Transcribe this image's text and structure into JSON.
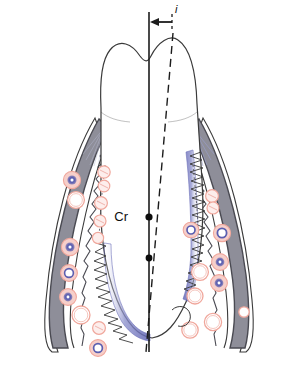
{
  "figure": {
    "type": "anatomical-diagram",
    "width": 298,
    "height": 365,
    "background_color": "#ffffff"
  },
  "labels": {
    "center_of_resistance": "Cr",
    "displacement_measure": "i"
  },
  "annotations": {
    "vertical_reference_line": {
      "name": "long-axis-reference-line",
      "style": "solid",
      "color": "#1c1c1c"
    },
    "tilted_axis_line": {
      "name": "tipped-tooth-axis-line",
      "style": "dashed",
      "color": "#1c1c1c"
    },
    "arrow": {
      "name": "displacement-arrow",
      "direction": "left",
      "color": "#1c1c1c"
    },
    "markers": [
      {
        "name": "center-of-resistance-dot",
        "label": "Cr"
      },
      {
        "name": "rotation-center-dot",
        "label": ""
      }
    ]
  },
  "structures": {
    "crown": {
      "name": "tooth-crown",
      "fill": "#ffffff",
      "stroke": "#3a3a3a"
    },
    "root": {
      "name": "tooth-root",
      "fill": "#ffffff",
      "stroke": "#3a3a3a"
    },
    "alveolar_bone": {
      "name": "alveolar-bone",
      "fill": "#8e8e99",
      "stroke": "#4a4a52"
    },
    "periodontal_ligament": {
      "name": "periodontal-ligament",
      "fill": "#6f73bc",
      "stroke": "#5a5ea8"
    },
    "pdl_fibers": {
      "name": "pdl-fiber-springs",
      "stroke": "#3a3a3a"
    },
    "gingiva": {
      "name": "gingiva",
      "fill": "#ffffff",
      "stroke": "#3a3a3a"
    }
  },
  "cells": {
    "vessel_color": "#f0a79c",
    "nucleus_color": "#5b5fb0",
    "osteoclast_color": "#f2a8a0",
    "legend": [
      {
        "name": "blood-vessel-cell",
        "color": "#f0a79c"
      },
      {
        "name": "inflammatory-cell",
        "color": "#5b5fb0"
      },
      {
        "name": "osteoclast-cell",
        "color": "#f2a8a0"
      }
    ]
  },
  "colors": {
    "bone_gray": "#8e8e99",
    "bone_outline": "#4a4a52",
    "pdl_blue": "#6f73bc",
    "cell_pink": "#f0a79c",
    "cell_purple": "#5b5fb0",
    "line_black": "#1c1c1c",
    "outline": "#3a3a3a"
  }
}
